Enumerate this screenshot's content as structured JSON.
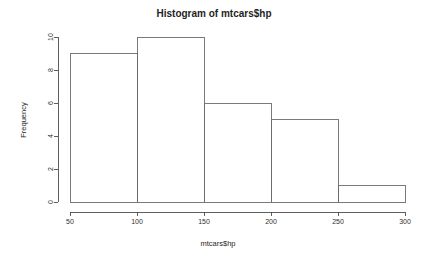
{
  "chart_data": {
    "type": "bar",
    "title": "Histogram of mtcars$hp",
    "xlabel": "mtcars$hp",
    "ylabel": "Frequency",
    "categories": [
      "50-100",
      "100-150",
      "150-200",
      "200-250",
      "250-300"
    ],
    "bin_edges": [
      50,
      100,
      150,
      200,
      250,
      300
    ],
    "values": [
      9,
      10,
      6,
      5,
      1
    ],
    "x_ticks": [
      50,
      100,
      150,
      200,
      250,
      300
    ],
    "x_tick_labels": [
      "50",
      "100",
      "150",
      "200",
      "250",
      "300"
    ],
    "y_ticks": [
      0,
      2,
      4,
      6,
      8,
      10
    ],
    "y_tick_labels": [
      "0",
      "2",
      "4",
      "6",
      "8",
      "10"
    ],
    "xlim": [
      50,
      300
    ],
    "ylim": [
      0,
      10
    ],
    "grid": false,
    "legend": "none",
    "bar_fill": "#ffffff",
    "bar_stroke": "#6b6b6b",
    "axis_color": "#4d4d4d",
    "background": "#ffffff"
  }
}
